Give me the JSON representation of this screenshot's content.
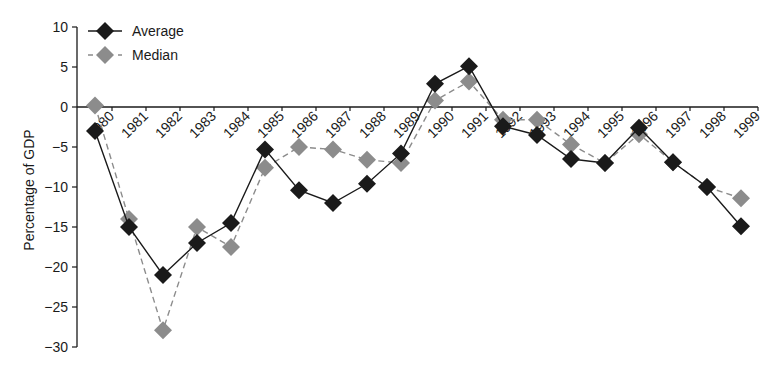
{
  "chart_data": {
    "type": "line",
    "title": "",
    "xlabel": "",
    "ylabel": "Percentage of GDP",
    "ylim": [
      -30,
      10
    ],
    "yticks": [
      10,
      5,
      0,
      -5,
      -10,
      -15,
      -20,
      -25,
      -30
    ],
    "ytick_labels": [
      "10",
      "5",
      "0",
      "−5",
      "−10",
      "−15",
      "−20",
      "−25",
      "−30"
    ],
    "grid": false,
    "legend_position": "upper left",
    "categories": [
      "1980",
      "1981",
      "1982",
      "1983",
      "1984",
      "1985",
      "1986",
      "1987",
      "1988",
      "1989",
      "1990",
      "1991",
      "1992",
      "1993",
      "1994",
      "1995",
      "1996",
      "1997",
      "1998",
      "1999"
    ],
    "series": [
      {
        "name": "Average",
        "style": "solid",
        "marker": "diamond",
        "color": "#1a1a1a",
        "values": [
          -3,
          -15,
          -21,
          -17,
          -14.5,
          -5.3,
          -10.4,
          -12,
          -9.6,
          -5.8,
          2.9,
          5.1,
          -2.4,
          -3.5,
          -6.5,
          -7,
          -2.6,
          -6.9,
          -10,
          -14.9
        ]
      },
      {
        "name": "Median",
        "style": "dashed",
        "marker": "diamond",
        "color": "#8c8c8c",
        "values": [
          0.2,
          -14,
          -27.9,
          -15,
          -17.5,
          -7.6,
          -5,
          -5.3,
          -6.6,
          -7,
          0.8,
          3.2,
          -1.6,
          -1.6,
          -4.7,
          -7,
          -3.4,
          -6.9,
          -10,
          -11.4
        ]
      }
    ]
  }
}
